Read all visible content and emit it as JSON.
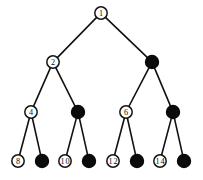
{
  "figure": {
    "background_color": "#ffffff",
    "line_color": "#111111",
    "open_node_fill": "#ffffff",
    "filled_node_fill": "#0b0b0b",
    "label_color": "#0d0d0d",
    "width": 203,
    "height": 180
  },
  "chart_data": {
    "type": "diagram",
    "diagram_kind": "binary-tree",
    "levels": 4,
    "node_count": 15,
    "nodes": [
      {
        "id": "n1",
        "label": "1",
        "style": "open",
        "level": 0,
        "x": 101,
        "y": 13
      },
      {
        "id": "n2",
        "label": "2",
        "style": "open",
        "level": 1,
        "x": 53,
        "y": 62
      },
      {
        "id": "n3",
        "label": "",
        "style": "filled",
        "level": 1,
        "x": 152,
        "y": 62
      },
      {
        "id": "n4",
        "label": "4",
        "style": "open",
        "level": 2,
        "x": 31,
        "y": 112
      },
      {
        "id": "n5",
        "label": "",
        "style": "filled",
        "level": 2,
        "x": 78,
        "y": 112
      },
      {
        "id": "n6",
        "label": "6",
        "style": "open",
        "level": 2,
        "x": 126,
        "y": 112
      },
      {
        "id": "n7",
        "label": "",
        "style": "filled",
        "level": 2,
        "x": 173,
        "y": 112
      },
      {
        "id": "n8",
        "label": "8",
        "style": "open",
        "level": 3,
        "x": 18,
        "y": 161
      },
      {
        "id": "n9",
        "label": "",
        "style": "filled",
        "level": 3,
        "x": 42,
        "y": 161
      },
      {
        "id": "n10",
        "label": "10",
        "style": "open",
        "level": 3,
        "x": 65,
        "y": 161
      },
      {
        "id": "n11",
        "label": "",
        "style": "filled",
        "level": 3,
        "x": 89,
        "y": 161
      },
      {
        "id": "n12",
        "label": "12",
        "style": "open",
        "level": 3,
        "x": 113,
        "y": 161
      },
      {
        "id": "n13",
        "label": "",
        "style": "filled",
        "level": 3,
        "x": 137,
        "y": 161
      },
      {
        "id": "n14",
        "label": "14",
        "style": "open",
        "level": 3,
        "x": 160,
        "y": 161
      },
      {
        "id": "n15",
        "label": "",
        "style": "filled",
        "level": 3,
        "x": 184,
        "y": 161
      }
    ],
    "edges": [
      {
        "from": "n1",
        "to": "n2"
      },
      {
        "from": "n1",
        "to": "n3"
      },
      {
        "from": "n2",
        "to": "n4"
      },
      {
        "from": "n2",
        "to": "n5"
      },
      {
        "from": "n3",
        "to": "n6"
      },
      {
        "from": "n3",
        "to": "n7"
      },
      {
        "from": "n4",
        "to": "n8"
      },
      {
        "from": "n4",
        "to": "n9"
      },
      {
        "from": "n5",
        "to": "n10"
      },
      {
        "from": "n5",
        "to": "n11"
      },
      {
        "from": "n6",
        "to": "n12"
      },
      {
        "from": "n6",
        "to": "n13"
      },
      {
        "from": "n7",
        "to": "n14"
      },
      {
        "from": "n7",
        "to": "n15"
      }
    ],
    "node_radius": {
      "open": 6.2,
      "filled": 6.6
    }
  }
}
